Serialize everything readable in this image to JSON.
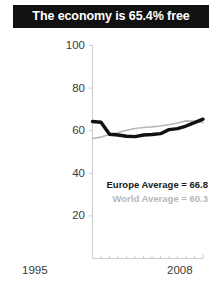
{
  "title": {
    "text": "The economy is 65.4% free"
  },
  "legend": {
    "europe_label": "Europe Average = 66.8",
    "world_label": "World Average = 60.3"
  },
  "axis": {
    "x_start_label": "1995",
    "x_end_label": "2008",
    "y_labels": [
      "100",
      "80",
      "60",
      "40",
      "20"
    ]
  },
  "colors": {
    "banner_background": "#111111",
    "banner_text": "#ffffff",
    "europe_line": "#111111",
    "world_line": "#b8b8b8",
    "axis": "#cccccc",
    "tick_text": "#3a3a3a"
  },
  "chart_data": {
    "type": "line",
    "title": "The economy is 65.4% free",
    "xlabel": "",
    "ylabel": "",
    "xlim": [
      1995,
      2008
    ],
    "ylim": [
      0,
      100
    ],
    "yticks": [
      20,
      40,
      60,
      80,
      100
    ],
    "xticks": [
      1995,
      1996,
      1997,
      1998,
      1999,
      2000,
      2001,
      2002,
      2003,
      2004,
      2005,
      2006,
      2007,
      2008
    ],
    "grid": false,
    "legend_position": "inside-right",
    "x": [
      1995,
      1996,
      1997,
      1998,
      1999,
      2000,
      2001,
      2002,
      2003,
      2004,
      2005,
      2006,
      2007,
      2008
    ],
    "series": [
      {
        "name": "Europe Average = 66.8",
        "color": "#111111",
        "values": [
          64.3,
          64.0,
          58.3,
          58.0,
          57.4,
          57.2,
          58.0,
          58.2,
          58.6,
          60.5,
          61.0,
          62.2,
          63.8,
          65.4
        ]
      },
      {
        "name": "World Average = 60.3",
        "color": "#b8b8b8",
        "values": [
          56.3,
          57.0,
          58.2,
          59.0,
          60.2,
          61.0,
          61.5,
          61.8,
          62.2,
          62.8,
          63.6,
          64.6,
          64.4,
          63.9
        ]
      }
    ],
    "annotations": [
      {
        "text": "Europe Average = 66.8",
        "style": "bold-dark"
      },
      {
        "text": "World Average = 60.3",
        "style": "bold-light"
      }
    ]
  }
}
